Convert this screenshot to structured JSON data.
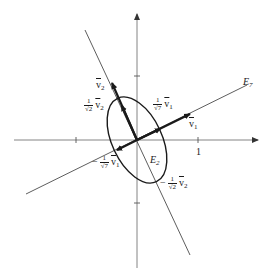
{
  "figure": {
    "type": "eigenvector-ellipse-diagram",
    "colors": {
      "axis": "#777777",
      "ink": "#1a1a1a",
      "background": "#ffffff"
    }
  },
  "axes": {
    "x_tick_label": "1",
    "ticks": {
      "x": [
        -1,
        1
      ],
      "y": [
        -1,
        1
      ]
    }
  },
  "lines": {
    "e7": {
      "label_base": "E",
      "label_sub": "7"
    },
    "e2": {
      "label_base": "E",
      "label_sub": "2"
    }
  },
  "vectors": {
    "v1": {
      "label_base": "v",
      "label_sub": "1"
    },
    "v2": {
      "label_base": "v",
      "label_sub": "2"
    },
    "scaled_v1": {
      "sign": "",
      "num": "1",
      "den": "√7",
      "vec_base": "v",
      "vec_sub": "1"
    },
    "scaled_v2": {
      "sign": "",
      "num": "1",
      "den": "√2",
      "vec_base": "v",
      "vec_sub": "2"
    },
    "neg_scaled_v1": {
      "sign": "−",
      "num": "1",
      "den": "√7",
      "vec_base": "v",
      "vec_sub": "1"
    },
    "neg_scaled_v2": {
      "sign": "−",
      "num": "1",
      "den": "√2",
      "vec_base": "v",
      "vec_sub": "2"
    }
  }
}
